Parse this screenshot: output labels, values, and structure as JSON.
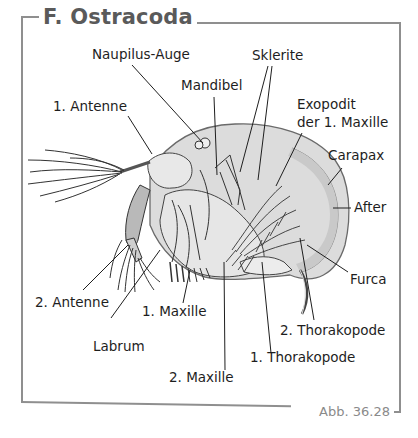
{
  "figure": {
    "title": "F. Ostracoda",
    "caption": "Abb. 36.28",
    "frame_color": "#8f8f8f",
    "carapace_fill": "#dcdcdc",
    "line_color": "#1e1e1e"
  },
  "labels": {
    "naupilus_auge": "Naupilus-Auge",
    "sklerite": "Sklerite",
    "mandibel": "Mandibel",
    "antenne_1": "1. Antenne",
    "exopodit_line1": "Exopodit",
    "exopodit_line2": "der 1. Maxille",
    "carapax": "Carapax",
    "after": "After",
    "furca": "Furca",
    "antenne_2": "2. Antenne",
    "maxille_1": "1. Maxille",
    "labrum": "Labrum",
    "thorakopode_2": "2. Thorakopode",
    "thorakopode_1": "1. Thorakopode",
    "maxille_2": "2. Maxille"
  }
}
